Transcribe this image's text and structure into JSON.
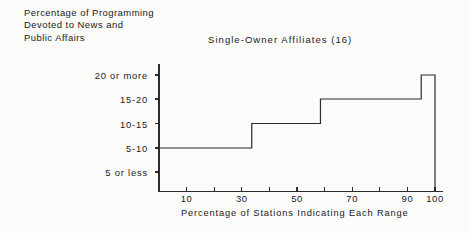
{
  "chart_data": {
    "type": "line",
    "title": "Single-Owner Affiliates (16)",
    "subtitle": "",
    "xlabel": "Percentage of Stations Indicating Each Range",
    "ylabel": "Percentage of Programming Devoted to News and Public Affairs",
    "ylabel_lines": [
      "Percentage of Programming",
      "Devoted to News and",
      "Public Affairs"
    ],
    "categories": [
      "5 or less",
      "5-10",
      "10-15",
      "15-20",
      "20 or more"
    ],
    "ytick_labels": [
      "20 or more",
      "15-20",
      "10-15",
      "5-10",
      "5 or less"
    ],
    "xlim": [
      0,
      100
    ],
    "xtick_values": [
      10,
      20,
      30,
      40,
      50,
      60,
      70,
      80,
      90,
      100
    ],
    "xtick_labels": [
      "10",
      "",
      "30",
      "",
      "50",
      "",
      "70",
      "",
      "90",
      "100"
    ],
    "grid": false,
    "legend": "none",
    "series": [
      {
        "name": "Single-Owner Affiliates (16)",
        "description": "Cumulative step plot: horizontal runs at each programming-percentage band.",
        "steps": [
          {
            "category": "5-10",
            "x_start": 0.0,
            "x_end": 33.6
          },
          {
            "category": "10-15",
            "x_start": 33.6,
            "x_end": 58.5
          },
          {
            "category": "15-20",
            "x_start": 58.5,
            "x_end": 95.0
          },
          {
            "category": "20 or more",
            "x_start": 95.0,
            "x_end": 100.0
          }
        ]
      }
    ],
    "line_color": "#2b2b2b",
    "axis_color": "#2b2b2b",
    "background_color": "#fbfbfa"
  }
}
